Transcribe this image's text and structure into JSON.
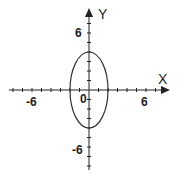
{
  "chart_data": {
    "type": "line",
    "title": "",
    "xlabel": "X",
    "ylabel": "Y",
    "origin_label": "0",
    "xlim": [
      -8.5,
      8
    ],
    "ylim": [
      -8,
      8.5
    ],
    "x_tick_labels": [
      "-6",
      "6"
    ],
    "y_tick_labels": [
      "6",
      "-6"
    ],
    "tick_step": 1,
    "grid": false,
    "series": [
      {
        "name": "ellipse",
        "equation": "x^2/4 + y^2/16 = 1",
        "center": [
          0,
          0
        ],
        "semi_axis_x": 2,
        "semi_axis_y": 4,
        "color": "#333333"
      }
    ]
  },
  "labels": {
    "x_axis": "X",
    "y_axis": "Y",
    "origin": "0",
    "x_neg": "-6",
    "x_pos": "6",
    "y_pos": "6",
    "y_neg": "-6"
  }
}
